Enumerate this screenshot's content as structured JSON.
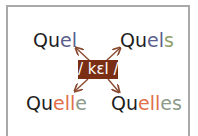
{
  "diagram": {
    "center_label": "/ kɛl /",
    "center_bg": "#7a2e14",
    "arrow_color": "#8a4a30",
    "words": [
      {
        "id": "quel",
        "parts": [
          {
            "text": "Qu",
            "color": "black"
          },
          {
            "text": "el",
            "color": "blue"
          }
        ]
      },
      {
        "id": "quels",
        "parts": [
          {
            "text": "Qu",
            "color": "black"
          },
          {
            "text": "el",
            "color": "blue"
          },
          {
            "text": "s",
            "color": "green"
          }
        ]
      },
      {
        "id": "quelle",
        "parts": [
          {
            "text": "Qu",
            "color": "black"
          },
          {
            "text": "elle",
            "color": "orange"
          },
          {
            "text": "",
            "color": "gray"
          }
        ]
      },
      {
        "id": "quelles",
        "parts": [
          {
            "text": "Qu",
            "color": "black"
          },
          {
            "text": "elle",
            "color": "orange"
          },
          {
            "text": "s",
            "color": "gray"
          }
        ]
      }
    ],
    "legend_colors": {
      "black": "#1e1e1e",
      "blue": "#5a5e8c",
      "orange": "#e0704a",
      "gray": "#8e9a8a",
      "green": "#8fa06a"
    }
  }
}
